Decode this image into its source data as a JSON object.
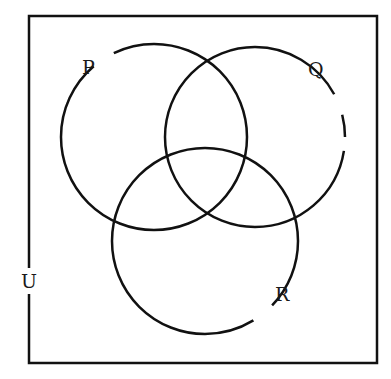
{
  "diagram": {
    "type": "venn",
    "universal_set": {
      "label": "U"
    },
    "sets": [
      {
        "id": "P",
        "label": "P"
      },
      {
        "id": "Q",
        "label": "Q"
      },
      {
        "id": "R",
        "label": "R"
      }
    ],
    "colors": {
      "stroke": "#111111",
      "background": "#ffffff"
    }
  }
}
